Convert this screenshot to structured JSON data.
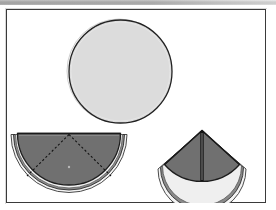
{
  "figure": {
    "background_color": "#ffffff",
    "frame_color": "#3a3a3a",
    "top_bar_color": "#a8a8a8"
  },
  "colors": {
    "open_napkin_fill": "#dcdcdc",
    "folded_napkin_fill": "#707070",
    "outline": "#222222",
    "hem_light": "#f0f0f0",
    "fold_line": "#1a1a1a",
    "dotted_guide": "#111111"
  },
  "shapes": [
    {
      "id": "open-circle",
      "name": "open round napkin",
      "type": "circle",
      "cx": 118,
      "cy": 70,
      "r": 52,
      "fill": "#dcdcdc",
      "stroke": "#222222",
      "stroke_width": 1.2
    },
    {
      "id": "half-fold",
      "name": "napkin folded in half",
      "type": "semicircle",
      "cx": 68,
      "cy": 133,
      "r": 61,
      "fill": "#707070",
      "stroke": "#1d1d1d",
      "stroke_width": 1.2,
      "guides": [
        {
          "name": "left-diagonal-fold",
          "x1": 68,
          "y1": 133,
          "x2": 25,
          "y2": 176
        },
        {
          "name": "right-diagonal-fold",
          "x1": 68,
          "y1": 133,
          "x2": 111,
          "y2": 176
        }
      ],
      "center_dot": {
        "cx": 68,
        "cy": 165,
        "r": 1.1
      }
    },
    {
      "id": "quarter-fold",
      "name": "napkin folded into quarter cone",
      "type": "quarter-circle",
      "apex_x": 201,
      "apex_y": 130,
      "r": 45,
      "fill": "#707070",
      "stroke": "#1d1d1d",
      "stroke_width": 1.2,
      "fold_line": {
        "name": "center-fold",
        "x1": 201,
        "y1": 131,
        "x2": 201,
        "y2": 176
      }
    }
  ]
}
